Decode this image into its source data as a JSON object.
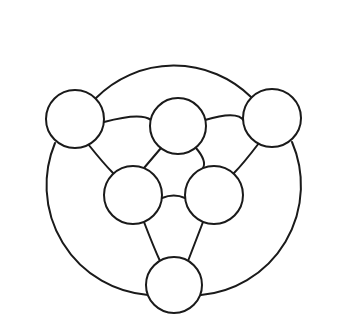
{
  "diagram": {
    "type": "graph-network",
    "canvas": {
      "width": 344,
      "height": 327,
      "background": "#ffffff"
    },
    "style": {
      "stroke_color": "#1a1a1a",
      "stroke_width": 2,
      "node_fill": "#ffffff"
    },
    "nodes": [
      {
        "id": "n1",
        "name": "outer-top-left",
        "cx": 75,
        "cy": 119,
        "r": 29,
        "label": ""
      },
      {
        "id": "n2",
        "name": "outer-top-right",
        "cx": 272,
        "cy": 118,
        "r": 29,
        "label": ""
      },
      {
        "id": "n3",
        "name": "outer-bottom",
        "cx": 174,
        "cy": 285,
        "r": 28,
        "label": ""
      },
      {
        "id": "n4",
        "name": "inner-top",
        "cx": 178,
        "cy": 126,
        "r": 28,
        "label": ""
      },
      {
        "id": "n5",
        "name": "inner-left",
        "cx": 133,
        "cy": 195,
        "r": 29,
        "label": ""
      },
      {
        "id": "n6",
        "name": "inner-right",
        "cx": 214,
        "cy": 195,
        "r": 29,
        "label": ""
      }
    ],
    "edges": [
      {
        "id": "e1",
        "name": "outer-arc-top",
        "from": "n1",
        "to": "n2",
        "kind": "outer-arc",
        "path": "M 96 98 A 110 110 0 0 1 251 97"
      },
      {
        "id": "e2",
        "name": "outer-arc-left",
        "from": "n1",
        "to": "n3",
        "kind": "outer-arc",
        "path": "M 55 143 A 110 110 0 0 0 148 295"
      },
      {
        "id": "e3",
        "name": "outer-arc-right",
        "from": "n2",
        "to": "n3",
        "kind": "outer-arc",
        "path": "M 292 142 A 110 110 0 0 1 201 295"
      },
      {
        "id": "e4",
        "name": "edge-topleft-innertop",
        "from": "n1",
        "to": "n4",
        "kind": "link",
        "path": "M 104 122 Q 141 112 151 120"
      },
      {
        "id": "e5",
        "name": "edge-innertop-topright",
        "from": "n4",
        "to": "n2",
        "kind": "link",
        "path": "M 205 120 Q 238 110 244 121"
      },
      {
        "id": "e6",
        "name": "edge-topleft-innerleft",
        "from": "n1",
        "to": "n5",
        "kind": "link",
        "path": "M 88 144 Q 104 164 113 173"
      },
      {
        "id": "e7",
        "name": "edge-topright-innerright",
        "from": "n2",
        "to": "n6",
        "kind": "link",
        "path": "M 259 143 Q 243 164 234 173"
      },
      {
        "id": "e8",
        "name": "edge-innertop-innerleft",
        "from": "n4",
        "to": "n5",
        "kind": "link",
        "path": "M 161 148 Q 150 161 144 168"
      },
      {
        "id": "e9",
        "name": "edge-innertop-innerright",
        "from": "n4",
        "to": "n6",
        "kind": "link",
        "path": "M 196 148 Q 207 161 203 168"
      },
      {
        "id": "e10",
        "name": "edge-innerleft-innerright",
        "from": "n5",
        "to": "n6",
        "kind": "link",
        "path": "M 162 198 Q 174 193 185 198"
      },
      {
        "id": "e11",
        "name": "edge-innerleft-bottom",
        "from": "n5",
        "to": "n3",
        "kind": "link",
        "path": "M 144 222 Q 154 248 160 261"
      },
      {
        "id": "e12",
        "name": "edge-innerright-bottom",
        "from": "n6",
        "to": "n3",
        "kind": "link",
        "path": "M 203 222 Q 193 248 188 261"
      }
    ]
  }
}
